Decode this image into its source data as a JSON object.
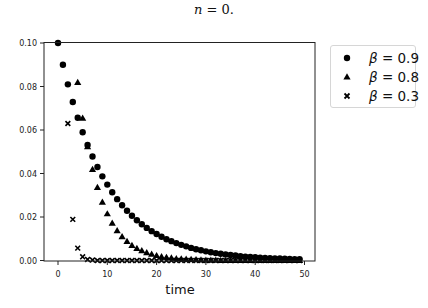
{
  "title": {
    "var": "n",
    "rest": " = 0."
  },
  "chart_data": {
    "type": "scatter",
    "title": "n = 0.",
    "xlabel": "time",
    "ylabel": "",
    "xlim": [
      -3.5,
      52
    ],
    "ylim": [
      0,
      0.1
    ],
    "xticks": [
      0,
      10,
      20,
      30,
      40,
      50
    ],
    "yticks": [
      0.0,
      0.02,
      0.04,
      0.06,
      0.08,
      0.1
    ],
    "xtick_labels": [
      "0",
      "10",
      "20",
      "30",
      "40",
      "50"
    ],
    "ytick_labels": [
      "0.00",
      "0.02",
      "0.04",
      "0.06",
      "0.08",
      "0.10"
    ],
    "grid": false,
    "legend_position": "outside upper right",
    "series": [
      {
        "name": "β = 0.9",
        "marker": "circle",
        "formula_hint": "0.1*0.9^t",
        "x_start": 0,
        "x_end": 49,
        "values": [
          0.1,
          0.09,
          0.081,
          0.0729,
          0.0656,
          0.059,
          0.0531,
          0.0478,
          0.043,
          0.0387,
          0.0349,
          0.0314,
          0.0282,
          0.0254,
          0.0229,
          0.0206,
          0.0185,
          0.0167,
          0.015,
          0.0135,
          0.0122,
          0.0109,
          0.0098,
          0.0089,
          0.008,
          0.0072,
          0.0065,
          0.0058,
          0.0052,
          0.0047,
          0.0042,
          0.0038,
          0.0034,
          0.0031,
          0.0028,
          0.0025,
          0.0023,
          0.002,
          0.0018,
          0.0016,
          0.0015,
          0.0013,
          0.0012,
          0.0011,
          0.001,
          0.0009,
          0.0008,
          0.0007,
          0.0006,
          0.0006
        ]
      },
      {
        "name": "β = 0.8",
        "marker": "triangle",
        "formula_hint": "0.2*0.8^t",
        "x_start": 4,
        "x_end": 49,
        "values": [
          0.0819,
          0.0655,
          0.0524,
          0.0419,
          0.0336,
          0.0268,
          0.0215,
          0.0172,
          0.0137,
          0.011,
          0.0088,
          0.007,
          0.0056,
          0.0045,
          0.0036,
          0.0029,
          0.0023,
          0.0018,
          0.0015,
          0.0012,
          0.0009,
          0.0008,
          0.0006,
          0.0005,
          0.0004,
          0.0003,
          0.0002,
          0.0002,
          0.0002,
          0.0001,
          0.0001,
          0.0001,
          0.0001,
          0,
          0,
          0,
          0,
          0,
          0,
          0,
          0,
          0,
          0,
          0,
          0,
          0
        ]
      },
      {
        "name": "β = 0.3",
        "marker": "x",
        "formula_hint": "0.7*0.3^t",
        "x_start": 2,
        "x_end": 49,
        "values": [
          0.063,
          0.0189,
          0.0057,
          0.0017,
          0.0005,
          0.0002,
          0,
          0,
          0,
          0,
          0,
          0,
          0,
          0,
          0,
          0,
          0,
          0,
          0,
          0,
          0,
          0,
          0,
          0,
          0,
          0,
          0,
          0,
          0,
          0,
          0,
          0,
          0,
          0,
          0,
          0,
          0,
          0,
          0,
          0,
          0,
          0,
          0,
          0,
          0,
          0,
          0,
          0
        ]
      }
    ]
  },
  "legend": {
    "items": [
      {
        "sym": "β",
        "rest": " = 0.9",
        "marker": "circle"
      },
      {
        "sym": "β",
        "rest": " = 0.8",
        "marker": "triangle"
      },
      {
        "sym": "β",
        "rest": " = 0.3",
        "marker": "x"
      }
    ]
  },
  "axes": {
    "xlabel": "time"
  }
}
